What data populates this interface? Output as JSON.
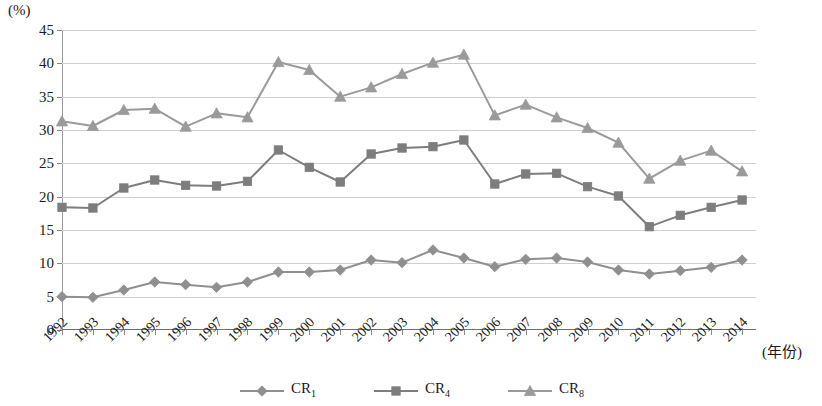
{
  "chart_data": {
    "type": "line",
    "title": "",
    "xlabel": "(年份)",
    "ylabel": "(%)",
    "ylim": [
      0,
      45
    ],
    "yticks": [
      0,
      5,
      10,
      15,
      20,
      25,
      30,
      35,
      40,
      45
    ],
    "grid": true,
    "legend_position": "bottom",
    "categories": [
      "1992",
      "1993",
      "1994",
      "1995",
      "1996",
      "1997",
      "1998",
      "1999",
      "2000",
      "2001",
      "2002",
      "2003",
      "2004",
      "2005",
      "2006",
      "2007",
      "2008",
      "2009",
      "2010",
      "2011",
      "2012",
      "2013",
      "2014"
    ],
    "series": [
      {
        "name": "CR1",
        "label": "CR",
        "subscript": "1",
        "marker": "diamond",
        "color": "#8f8f8f",
        "values": [
          5.0,
          4.9,
          6.0,
          7.2,
          6.8,
          6.4,
          7.2,
          8.7,
          8.7,
          9.0,
          10.5,
          10.1,
          12.0,
          10.8,
          9.5,
          10.6,
          10.8,
          10.2,
          9.0,
          8.4,
          8.9,
          9.4,
          10.5
        ]
      },
      {
        "name": "CR4",
        "label": "CR",
        "subscript": "4",
        "marker": "square",
        "color": "#7d7d7d",
        "values": [
          18.4,
          18.3,
          21.3,
          22.5,
          21.7,
          21.6,
          22.3,
          27.0,
          24.4,
          22.2,
          26.4,
          27.3,
          27.5,
          28.5,
          21.9,
          23.4,
          23.5,
          21.5,
          20.1,
          15.5,
          17.2,
          18.4,
          19.5
        ]
      },
      {
        "name": "CR8",
        "label": "CR",
        "subscript": "8",
        "marker": "triangle",
        "color": "#9a9a9a",
        "values": [
          31.3,
          30.6,
          33.0,
          33.2,
          30.5,
          32.5,
          31.9,
          40.2,
          39.0,
          35.0,
          36.4,
          38.4,
          40.1,
          41.3,
          32.2,
          33.8,
          31.9,
          30.3,
          28.1,
          22.7,
          25.4,
          26.9,
          23.8
        ]
      }
    ]
  },
  "axis": {
    "y_unit_label": "(%)",
    "x_unit_label": "(年份)"
  }
}
